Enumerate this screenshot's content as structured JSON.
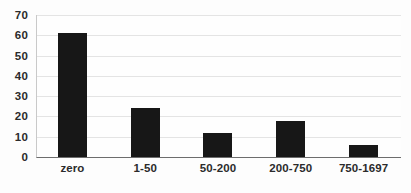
{
  "chart_data": {
    "type": "bar",
    "title": "",
    "subtitle": "",
    "xlabel": "",
    "ylabel": "",
    "categories": [
      "zero",
      "1-50",
      "50-200",
      "200-750",
      "750-1697"
    ],
    "values": [
      61,
      24,
      12,
      18,
      6
    ],
    "ylim": [
      0,
      70
    ],
    "yticks": [
      0,
      10,
      20,
      30,
      40,
      50,
      60,
      70
    ],
    "ytick_labels": [
      "0",
      "10",
      "20",
      "30",
      "40",
      "50",
      "60",
      "70"
    ],
    "grid": true,
    "grid_axis": "y",
    "legend": false,
    "legend_position": "none",
    "bar_color": "#171717",
    "gridline_color": "#e4e4e4",
    "axis_color": "#6d6d6d",
    "background_color": "#fdfdfd",
    "text_color": "#2b2b2b"
  }
}
